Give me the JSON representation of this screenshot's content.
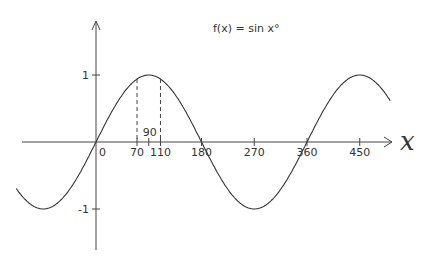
{
  "title": "f(x) = sin x°",
  "axes": {
    "x_label": "x",
    "x_ticks": [
      {
        "value": 0,
        "label": "0"
      },
      {
        "value": 70,
        "label": "70"
      },
      {
        "value": 90,
        "label": "90"
      },
      {
        "value": 110,
        "label": "110"
      },
      {
        "value": 180,
        "label": "180"
      },
      {
        "value": 270,
        "label": "270"
      },
      {
        "value": 360,
        "label": "360"
      },
      {
        "value": 450,
        "label": "450"
      }
    ],
    "y_ticks": [
      {
        "value": 1,
        "label": "1"
      },
      {
        "value": -1,
        "label": "-1"
      }
    ]
  },
  "annotations": {
    "dashed_lines_at": [
      70,
      110
    ],
    "note": "sin 70° = sin 110°"
  },
  "chart_data": {
    "type": "line",
    "title": "f(x) = sin x°",
    "xlabel": "x",
    "ylabel": "",
    "function": "sin(x°)",
    "xlim": [
      -150,
      530
    ],
    "ylim": [
      -1.5,
      1.5
    ],
    "x_ticks": [
      0,
      70,
      90,
      110,
      180,
      270,
      360,
      450
    ],
    "y_ticks": [
      -1,
      1
    ],
    "grid": false,
    "series": [
      {
        "name": "sin x",
        "x": [
          -135,
          -90,
          -45,
          0,
          45,
          70,
          90,
          110,
          135,
          180,
          225,
          270,
          315,
          360,
          405,
          450,
          495
        ],
        "values": [
          -0.707,
          -1,
          -0.707,
          0,
          0.707,
          0.94,
          1,
          0.94,
          0.707,
          0,
          -0.707,
          -1,
          -0.707,
          0,
          0.707,
          1,
          0.707
        ]
      }
    ]
  }
}
